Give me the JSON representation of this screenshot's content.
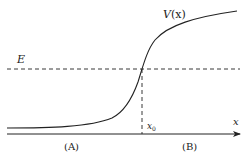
{
  "diagram": {
    "curve_label": "V(x)",
    "curve_label_var": "V",
    "curve_label_arg": "(x)",
    "energy_label": "E",
    "turning_point_label": "x",
    "turning_point_sub": "0",
    "axis_label": "x",
    "region_left": "(A)",
    "region_right": "(B)",
    "colors": {
      "stroke": "#222222",
      "background": "#ffffff"
    }
  }
}
